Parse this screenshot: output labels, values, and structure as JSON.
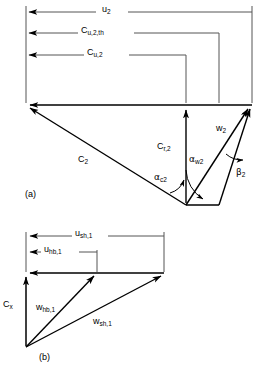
{
  "figure": {
    "type": "velocity-triangle-diagram",
    "panels": [
      {
        "id": "a",
        "caption": "(a)",
        "description": "Impeller exit velocity triangle with slip",
        "dimension_labels": [
          {
            "name": "u2",
            "text_main": "u",
            "text_sub": "2",
            "role": "blade-speed"
          },
          {
            "name": "cu2th",
            "text_main": "C",
            "text_sub": "u,2,th",
            "role": "theoretical-tangential-velocity"
          },
          {
            "name": "cu2",
            "text_main": "C",
            "text_sub": "u,2",
            "role": "actual-tangential-velocity"
          }
        ],
        "vector_labels": [
          {
            "name": "c2",
            "text_main": "C",
            "text_sub": "2",
            "role": "absolute-velocity"
          },
          {
            "name": "cr2",
            "text_main": "C",
            "text_sub": "r,2",
            "role": "radial-velocity"
          },
          {
            "name": "w2",
            "text_main": "w",
            "text_sub": "2",
            "role": "relative-velocity"
          }
        ],
        "angle_labels": [
          {
            "name": "alpha-c2",
            "glyph": "α",
            "text_sub": "c2",
            "role": "absolute-flow-angle"
          },
          {
            "name": "alpha-w2",
            "glyph": "α",
            "text_sub": "w2",
            "role": "relative-flow-angle"
          },
          {
            "name": "beta-2",
            "glyph": "β",
            "text_sub": "2",
            "role": "blade-angle"
          }
        ]
      },
      {
        "id": "b",
        "caption": "(b)",
        "description": "Inducer inlet velocity triangles at hub and shroud",
        "dimension_labels": [
          {
            "name": "ush1",
            "text_main": "u",
            "text_sub": "sh,1",
            "role": "shroud-blade-speed"
          },
          {
            "name": "uhb1",
            "text_main": "u",
            "text_sub": "hb,1",
            "role": "hub-blade-speed"
          }
        ],
        "vector_labels": [
          {
            "name": "cx",
            "text_main": "C",
            "text_sub": "x",
            "role": "axial-velocity"
          },
          {
            "name": "whb1",
            "text_main": "w",
            "text_sub": "hb,1",
            "role": "hub-relative-velocity"
          },
          {
            "name": "wsh1",
            "text_main": "w",
            "text_sub": "sh,1",
            "role": "shroud-relative-velocity"
          }
        ]
      }
    ],
    "colors": {
      "stroke": "#000000",
      "background": "#ffffff",
      "thin_rule": "#555555"
    }
  }
}
